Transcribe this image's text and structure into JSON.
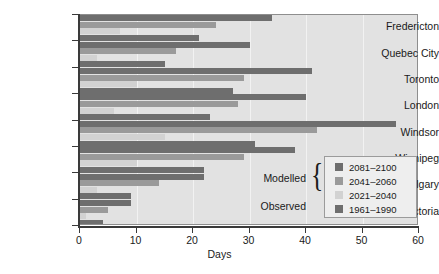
{
  "chart_data": {
    "type": "bar",
    "orientation": "horizontal",
    "title": "",
    "xlabel": "Days",
    "ylabel": "",
    "xlim": [
      0,
      60
    ],
    "xticks": [
      0,
      10,
      20,
      30,
      40,
      50,
      60
    ],
    "grid": true,
    "legend_position": "inside-lower-right",
    "categories": [
      "Fredericton",
      "Quebec City",
      "Toronto",
      "London",
      "Windsor",
      "Winnipeg",
      "Calgary",
      "Victoria"
    ],
    "series": [
      {
        "name": "2081–2100",
        "group": "Modelled",
        "color": "#6e6e6e",
        "values": [
          34,
          30,
          41,
          40,
          56,
          38,
          22,
          9
        ]
      },
      {
        "name": "2041–2060",
        "group": "Modelled",
        "color": "#9a9a9a",
        "values": [
          24,
          17,
          29,
          28,
          42,
          29,
          14,
          5
        ]
      },
      {
        "name": "2021–2040",
        "group": "Modelled",
        "color": "#d2d2d2",
        "values": [
          7,
          3,
          10,
          6,
          15,
          10,
          3,
          1
        ]
      },
      {
        "name": "1961–1990",
        "group": "Observed",
        "color": "#6e6e6e",
        "values": [
          21,
          15,
          27,
          23,
          31,
          22,
          9,
          4
        ]
      }
    ]
  },
  "axis": {
    "x_title": "Days",
    "tick_labels": [
      "0",
      "10",
      "20",
      "30",
      "40",
      "50",
      "60"
    ]
  },
  "legend": {
    "group_labels": [
      {
        "text": "Modelled"
      },
      {
        "text": "Observed"
      }
    ],
    "entries": [
      {
        "label": "2081–2100",
        "color": "#6e6e6e"
      },
      {
        "label": "2041–2060",
        "color": "#9a9a9a"
      },
      {
        "label": "2021–2040",
        "color": "#d2d2d2"
      },
      {
        "label": "1961–1990",
        "color": "#6e6e6e"
      }
    ]
  },
  "colors": {
    "plot_background": "#e2e2e2",
    "axis": "#3a3a3a",
    "gridline": "#f2f2f2",
    "legend_background": "#eeeeee"
  }
}
